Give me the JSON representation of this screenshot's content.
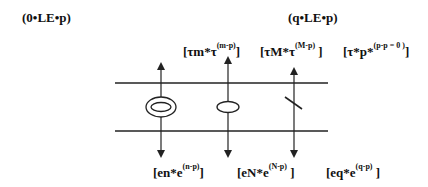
{
  "headers": {
    "left": "(0•LE•p)",
    "right": "(q•LE•p)"
  },
  "top_labels": [
    {
      "base": "[τm*τ",
      "exp": "(m-p)",
      "close": "]"
    },
    {
      "base": "[τM*τ",
      "exp": "(M-p)",
      "close": " ]"
    },
    {
      "base": "[τ*p*",
      "exp": "(p-p = 0 )",
      "close": "]"
    }
  ],
  "bottom_labels": [
    {
      "base": "[en*e",
      "exp": "(n-p)",
      "close": "]"
    },
    {
      "base": "[eN*e",
      "exp": "(N-p)",
      "close": " ]"
    },
    {
      "base": "[eq*e",
      "exp": "(q-p)",
      "close": " ]"
    }
  ],
  "symbols": {
    "left": "double-ellipse",
    "middle": "single-ellipse",
    "right": "slash"
  },
  "colors": {
    "line": "#222222",
    "background": "#ffffff"
  }
}
